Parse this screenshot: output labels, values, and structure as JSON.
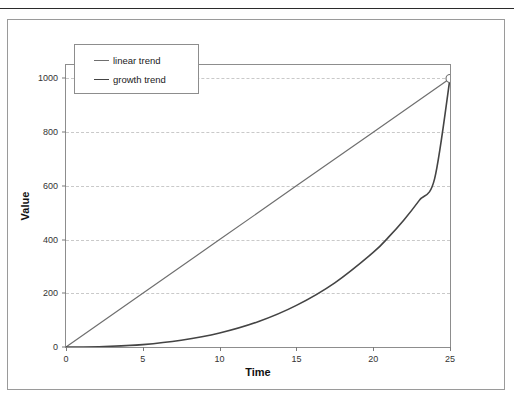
{
  "document": {
    "clipped_header_text": "",
    "background_color": "#ffffff"
  },
  "chart_data": {
    "type": "line",
    "title": "",
    "subtitle": "",
    "xlabel": "Time",
    "ylabel": "Value",
    "xlim": [
      0,
      25
    ],
    "ylim": [
      0,
      1050
    ],
    "xticks": [
      0,
      5,
      10,
      15,
      20,
      25
    ],
    "yticks": [
      0,
      200,
      400,
      600,
      800,
      1000
    ],
    "xtick_labels": [
      "0",
      "5",
      "10",
      "15",
      "20",
      "25"
    ],
    "ytick_labels": [
      "0",
      "200",
      "400",
      "600",
      "800",
      "1000"
    ],
    "grid": {
      "horizontal": true,
      "vertical": false,
      "style": "dashed",
      "color": "#c9c9c9"
    },
    "legend": {
      "position": "upper-left-inside",
      "entries": [
        {
          "label": "linear trend",
          "color": "#6f6f6f"
        },
        {
          "label": "growth trend",
          "color": "#444444"
        }
      ]
    },
    "endpoint_marker": {
      "x": 25,
      "y": 1000,
      "shape": "open-circle",
      "color": "#6b6b6b"
    },
    "series": [
      {
        "name": "linear trend",
        "color": "#6f6f6f",
        "width": 1.2,
        "x": [
          0,
          5,
          10,
          15,
          20,
          25
        ],
        "values": [
          0,
          200,
          400,
          600,
          800,
          1000
        ]
      },
      {
        "name": "growth trend",
        "color": "#444444",
        "width": 1.6,
        "x": [
          0,
          2.5,
          5,
          7.5,
          10,
          12.5,
          15,
          17.5,
          20,
          21,
          22,
          23,
          24,
          25
        ],
        "values": [
          0,
          2,
          9,
          25,
          52,
          94,
          155,
          239,
          352,
          409,
          473,
          546,
          627,
          1000
        ]
      }
    ]
  },
  "axis_labels": {
    "x": "Time",
    "y": "Value"
  }
}
